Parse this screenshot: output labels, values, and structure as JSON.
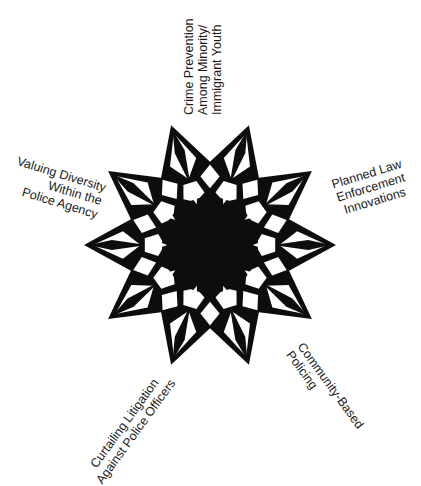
{
  "diagram": {
    "type": "ten-pointed star with five surrounding labels",
    "colors": {
      "star": "#0d0d0d",
      "background": "#ffffff",
      "text": "#1a1a1a"
    },
    "labels": [
      {
        "id": "top",
        "text": "Crime Prevention\nAmong Minority/\nImmigrant Youth"
      },
      {
        "id": "left",
        "text": "Valuing Diversity\nWithin the\nPolice Agency"
      },
      {
        "id": "right",
        "text": "Planned Law\nEnforcement\nInnovations"
      },
      {
        "id": "bottom-left",
        "text": "Curtailing Litigation\nAgainst Police Officers"
      },
      {
        "id": "bottom-right",
        "text": "Community-Based\nPolicing"
      }
    ]
  }
}
